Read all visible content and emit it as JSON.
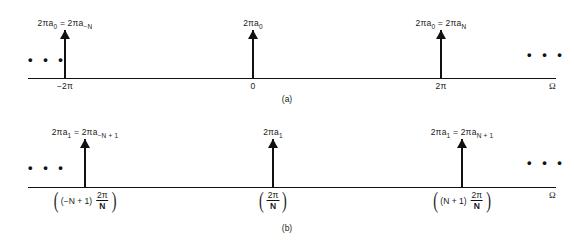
{
  "figure": {
    "axis_symbol": "Ω",
    "ellipsis": "• • •"
  },
  "chart_data": {
    "type": "line",
    "xlabel": "Ω",
    "ylabel": "",
    "panels": [
      {
        "id": "a",
        "caption": "(a)",
        "x_ticks": [
          "−2π",
          "0",
          "2π"
        ],
        "x_tick_positions": [
          -6.2832,
          0,
          6.2832
        ],
        "impulses": [
          {
            "label_html": "2πa<sub>0</sub> = 2πa<sub>−N</sub>",
            "x": "−2π",
            "height": 1
          },
          {
            "label_html": "2πa<sub>0</sub>",
            "x": "0",
            "height": 1
          },
          {
            "label_html": "2πa<sub>0</sub> = 2πa<sub>N</sub>",
            "x": "2π",
            "height": 1
          }
        ],
        "left_ellipsis": "• • •",
        "right_ellipsis": "• • •"
      },
      {
        "id": "b",
        "caption": "(b)",
        "x_ticks": [
          "(−N + 1) 2π/N",
          "2π/N",
          "(N + 1) 2π/N"
        ],
        "impulses": [
          {
            "label_html": "2πa<sub>1</sub> = 2πa<sub>−N + 1</sub>",
            "x": "(−N + 1) 2π/N",
            "height": 1
          },
          {
            "label_html": "2πa<sub>1</sub>",
            "x": "2π/N",
            "height": 1
          },
          {
            "label_html": "2πa<sub>1</sub> = 2πa<sub>N + 1</sub>",
            "x": "(N + 1) 2π/N",
            "height": 1
          }
        ],
        "left_ellipsis": "• • •",
        "right_ellipsis": "• • •"
      }
    ]
  },
  "panel_a": {
    "amp_left": "2πa<sub>0</sub> = 2πa<sub>−N</sub>",
    "amp_mid": "2πa<sub>0</sub>",
    "amp_right": "2πa<sub>0</sub> = 2πa<sub>N</sub>",
    "tick_left": "−2π",
    "tick_mid": "0",
    "tick_right": "2π",
    "omega": "Ω",
    "caption": "(a)",
    "ellipsis_left": "• • •",
    "ellipsis_right": "• • •"
  },
  "panel_b": {
    "amp_left": "2πa<sub>1</sub> = 2πa<sub>−N + 1</sub>",
    "amp_mid": "2πa<sub>1</sub>",
    "amp_right": "2πa<sub>1</sub> = 2πa<sub>N + 1</sub>",
    "tick_left_coef": "(−N + 1)",
    "tick_left_num": "2π",
    "tick_left_den": "N",
    "tick_mid_num": "2π",
    "tick_mid_den": "N",
    "tick_right_coef": "(N + 1)",
    "tick_right_num": "2π",
    "tick_right_den": "N",
    "paren_open": "(",
    "paren_close": ")",
    "omega": "Ω",
    "caption": "(b)",
    "ellipsis_left": "• • •",
    "ellipsis_right": "• • •"
  }
}
